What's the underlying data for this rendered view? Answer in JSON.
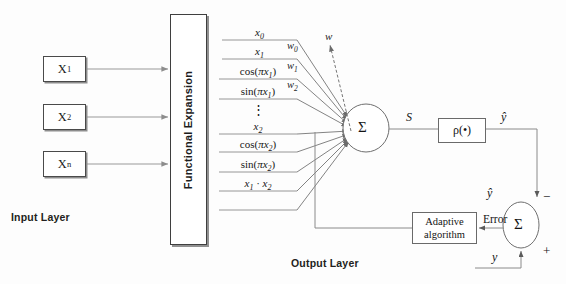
{
  "diagram": {
    "layer_labels": {
      "input": "Input Layer",
      "output": "Output Layer"
    },
    "input_nodes": [
      {
        "name": "input-box-1",
        "label_base": "X",
        "label_sub": "1"
      },
      {
        "name": "input-box-2",
        "label_base": "X",
        "label_sub": "2"
      },
      {
        "name": "input-box-n",
        "label_base": "X",
        "label_sub": "n"
      }
    ],
    "functional_expansion": {
      "block_label": "Functional Expansion",
      "terms": [
        {
          "id": "term-x0",
          "kind": "math",
          "text": "x0",
          "base": "x",
          "sub": "0"
        },
        {
          "id": "term-x1",
          "kind": "math",
          "text": "x1",
          "base": "x",
          "sub": "1"
        },
        {
          "id": "term-cos-pi-x1",
          "kind": "math",
          "text": "cos(πx1)"
        },
        {
          "id": "term-sin-pi-x1",
          "kind": "math",
          "text": "sin(πx1)"
        },
        {
          "id": "term-vertical-dots",
          "kind": "dots",
          "text": "⋮"
        },
        {
          "id": "term-x2",
          "kind": "math",
          "text": "x2",
          "base": "x",
          "sub": "2"
        },
        {
          "id": "term-cos-pi-x2",
          "kind": "math",
          "text": "cos(πx2)"
        },
        {
          "id": "term-sin-pi-x2",
          "kind": "math",
          "text": "sin(πx2)"
        },
        {
          "id": "term-x1-dot-x2",
          "kind": "math",
          "text": "x1 · x2"
        }
      ]
    },
    "weights": {
      "labels": [
        {
          "id": "weight-w0",
          "base": "w",
          "sub": "0"
        },
        {
          "id": "weight-w1",
          "base": "w",
          "sub": "1"
        },
        {
          "id": "weight-w2",
          "base": "w",
          "sub": "2"
        }
      ],
      "update_arrow_label": "w"
    },
    "nodes": {
      "sum_neuron": {
        "glyph": "Σ",
        "name": "summation-node"
      },
      "activation": {
        "label": "ρ(•)",
        "name": "activation-function-box"
      },
      "error_sum": {
        "glyph": "Σ",
        "name": "error-summation-node"
      }
    },
    "signals": {
      "net_input": "S",
      "predicted_output": "ŷ",
      "predicted_output_feedback": "ŷ",
      "desired_output": "y",
      "error": "Error",
      "minus_sign": "−",
      "plus_sign": "+"
    },
    "adaptive_block": {
      "line1": "Adaptive",
      "line2": "algorithm"
    },
    "colors": {
      "stroke_dark": "#4a4a4a",
      "stroke_light": "#8d8d8d",
      "stroke_line": "#777777",
      "text": "#161616",
      "background": "#fdfdfd"
    }
  }
}
